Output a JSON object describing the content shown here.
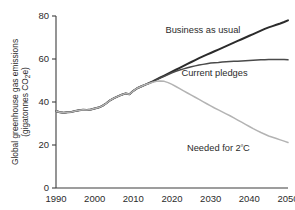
{
  "chart_data": {
    "type": "line",
    "title": "",
    "xlabel": "",
    "ylabel": "Global greenhouse gas emissions (gigatonnes CO2e)",
    "ylabel_line1": "Global greenhouse gas emissions",
    "ylabel_line2_pre": "(gigatonnes CO",
    "ylabel_line2_sub": "2",
    "ylabel_line2_post": "e)",
    "xlim": [
      1990,
      2050
    ],
    "ylim": [
      0,
      80
    ],
    "xticks": [
      1990,
      2000,
      2010,
      2020,
      2030,
      2040,
      2050
    ],
    "xticklabels": [
      "1990",
      "2000",
      "2010",
      "2020",
      "2030",
      "2040",
      "2050"
    ],
    "yticks": [
      0,
      20,
      40,
      60,
      80
    ],
    "yticklabels": [
      "0",
      "20",
      "40",
      "60",
      "80"
    ],
    "grid": false,
    "legend_position": "inline-annotations",
    "x": [
      1990,
      1991,
      1992,
      1993,
      1994,
      1995,
      1996,
      1997,
      1998,
      1999,
      2000,
      2001,
      2002,
      2003,
      2004,
      2005,
      2006,
      2007,
      2008,
      2009,
      2010,
      2011,
      2012,
      2013,
      2014,
      2015,
      2016,
      2017,
      2018,
      2019,
      2020,
      2021,
      2022,
      2023,
      2024,
      2025,
      2026,
      2027,
      2028,
      2029,
      2030,
      2031,
      2032,
      2033,
      2034,
      2035,
      2036,
      2037,
      2038,
      2039,
      2040,
      2041,
      2042,
      2043,
      2044,
      2045,
      2046,
      2047,
      2048,
      2049,
      2050
    ],
    "series": [
      {
        "name": "Business as usual",
        "color": "#2b2b2b",
        "label_x": 2028,
        "label_y": 72,
        "values": [
          35.8,
          35.2,
          35.0,
          35.2,
          35.4,
          35.8,
          36.2,
          36.4,
          36.3,
          36.5,
          37.0,
          37.4,
          38.2,
          39.4,
          40.8,
          41.8,
          42.6,
          43.4,
          44.0,
          43.6,
          45.2,
          46.4,
          47.2,
          48.0,
          48.8,
          49.6,
          50.5,
          51.4,
          52.3,
          53.2,
          54.1,
          55.0,
          55.9,
          56.8,
          57.7,
          58.6,
          59.5,
          60.4,
          61.2,
          62.0,
          62.8,
          63.6,
          64.4,
          65.2,
          66.0,
          66.8,
          67.6,
          68.4,
          69.2,
          70.0,
          70.8,
          71.6,
          72.4,
          73.2,
          74.0,
          74.7,
          75.3,
          75.9,
          76.5,
          77.2,
          78.0
        ]
      },
      {
        "name": "Current pledges",
        "color": "#4a4a4a",
        "label_x": 2031,
        "label_y": 52,
        "values": [
          35.8,
          35.2,
          35.0,
          35.2,
          35.4,
          35.8,
          36.2,
          36.4,
          36.3,
          36.5,
          37.0,
          37.4,
          38.2,
          39.4,
          40.8,
          41.8,
          42.6,
          43.4,
          44.0,
          43.6,
          45.2,
          46.4,
          47.2,
          48.0,
          48.6,
          49.4,
          50.3,
          51.2,
          52.0,
          52.8,
          53.6,
          54.3,
          54.9,
          55.4,
          55.9,
          56.4,
          56.8,
          57.2,
          57.5,
          57.8,
          58.1,
          58.3,
          58.4,
          58.6,
          58.7,
          58.8,
          58.9,
          59.0,
          59.1,
          59.2,
          59.3,
          59.4,
          59.5,
          59.6,
          59.7,
          59.8,
          59.8,
          59.8,
          59.8,
          59.8,
          59.6
        ]
      },
      {
        "name": "Needed for 2ºC",
        "color": "#b3b3b3",
        "label_x": 2032,
        "label_y": 17,
        "values": [
          35.8,
          35.2,
          35.0,
          35.2,
          35.4,
          35.8,
          36.2,
          36.4,
          36.3,
          36.5,
          37.0,
          37.4,
          38.2,
          39.4,
          40.8,
          41.8,
          42.6,
          43.4,
          44.0,
          43.6,
          45.2,
          46.4,
          47.2,
          48.0,
          48.6,
          49.2,
          49.6,
          49.8,
          49.6,
          49.0,
          48.2,
          47.2,
          46.2,
          45.2,
          44.2,
          43.2,
          42.2,
          41.2,
          40.2,
          39.2,
          38.2,
          37.2,
          36.3,
          35.4,
          34.5,
          33.6,
          32.6,
          31.6,
          30.6,
          29.6,
          28.6,
          27.6,
          26.7,
          25.8,
          25.0,
          24.2,
          23.6,
          23.0,
          22.4,
          21.8,
          21.2
        ]
      }
    ],
    "annotations": [
      {
        "text": "Business as usual",
        "series": 0
      },
      {
        "text": "Current pledges",
        "series": 1
      },
      {
        "text": "Needed for 2ºC",
        "series": 2
      }
    ]
  }
}
